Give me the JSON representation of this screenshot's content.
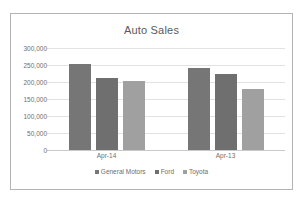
{
  "chart_data": {
    "type": "bar",
    "title": "Auto Sales",
    "xlabel": "",
    "ylabel": "",
    "categories": [
      "Apr-14",
      "Apr-13"
    ],
    "series": [
      {
        "name": "General Motors",
        "values": [
          253000,
          241000
        ],
        "color": "#767676"
      },
      {
        "name": "Ford",
        "values": [
          212000,
          223000
        ],
        "color": "#6f6f6f"
      },
      {
        "name": "Toyota",
        "values": [
          203000,
          180000
        ],
        "color": "#a0a0a0"
      }
    ],
    "ylim": [
      0,
      300000
    ],
    "yticks": [
      300000,
      250000,
      200000,
      150000,
      100000,
      50000,
      0
    ],
    "ytick_labels": [
      "300,000",
      "250,000",
      "200,000",
      "150,000",
      "100,000",
      "50,000",
      "0"
    ],
    "grid": true,
    "legend_position": "bottom",
    "frame_color": "#b4b4b4",
    "gridline_color": "#e2e2e2",
    "text_color": "#6e6e6e"
  }
}
